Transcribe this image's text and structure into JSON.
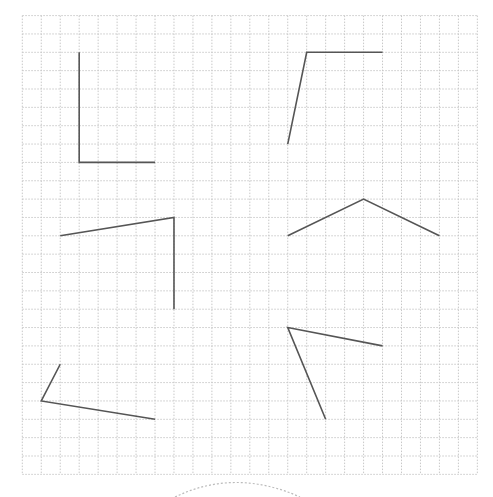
{
  "grid": {
    "origin_x": 22.3,
    "origin_y": 15.6,
    "cols": 24,
    "rows": 25,
    "cell_w": 18.96,
    "cell_h": 18.35,
    "color": "#c8c8c8",
    "dash": "1.5,1.5"
  },
  "line_color": "#555555",
  "line_width": 1.6,
  "angles": [
    {
      "name": "angle-top-left",
      "points": [
        [
          3,
          2
        ],
        [
          3,
          8
        ],
        [
          7,
          8
        ]
      ]
    },
    {
      "name": "angle-top-right",
      "points": [
        [
          14,
          7
        ],
        [
          15,
          2
        ],
        [
          19,
          2
        ]
      ]
    },
    {
      "name": "angle-middle-left",
      "points": [
        [
          2,
          12
        ],
        [
          8,
          11
        ],
        [
          8,
          16
        ]
      ]
    },
    {
      "name": "angle-middle-right",
      "points": [
        [
          14,
          12
        ],
        [
          18,
          10
        ],
        [
          22,
          12
        ]
      ]
    },
    {
      "name": "angle-bottom-left",
      "points": [
        [
          2,
          19
        ],
        [
          1,
          21
        ],
        [
          7,
          22
        ]
      ]
    },
    {
      "name": "angle-bottom-right",
      "points": [
        [
          19,
          18
        ],
        [
          14,
          17
        ],
        [
          16,
          22
        ]
      ]
    }
  ],
  "arc": {
    "name": "dashed-arc",
    "path": "M 175 497 Q 235 468 300 497",
    "color": "#bbbbbb",
    "dash": "2,2"
  }
}
